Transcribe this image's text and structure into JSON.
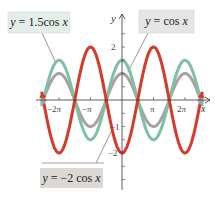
{
  "chart_data": {
    "type": "line",
    "title": "",
    "xlabel": "x",
    "ylabel": "y",
    "xlim": [
      -8.2,
      8.2
    ],
    "ylim": [
      -3.4,
      3.1
    ],
    "x_ticks": [
      {
        "value": -6.2832,
        "label": "−2π"
      },
      {
        "value": -3.1416,
        "label": "−π"
      },
      {
        "value": 3.1416,
        "label": "π"
      },
      {
        "value": 6.2832,
        "label": "2π"
      }
    ],
    "y_ticks": [
      {
        "value": 2,
        "label": "2"
      },
      {
        "value": -1,
        "label": "−1"
      },
      {
        "value": -2,
        "label": "−2"
      }
    ],
    "grid": false,
    "series": [
      {
        "name": "y = 1.5cos x",
        "expression": "1.5*cos(x)",
        "amplitude": 1.5,
        "color": "#7fbfa4"
      },
      {
        "name": "y = cos x",
        "expression": "cos(x)",
        "amplitude": 1,
        "color": "#a8a2a4"
      },
      {
        "name": "y = −2 cos x",
        "expression": "-2*cos(x)",
        "amplitude": -2,
        "color": "#d63a2a"
      }
    ],
    "annotations": [
      {
        "text": "y = 1.5cos x",
        "box_color": "#e3eee8"
      },
      {
        "text": "y = cos x",
        "box_color": "#e5e5e5"
      },
      {
        "text": "y = −2 cos x",
        "box_color": "#dcd9d4"
      }
    ]
  },
  "labels": {
    "green": {
      "y": "y",
      "eq": " = 1.5cos ",
      "x": "x"
    },
    "gray": {
      "y": "y",
      "eq": " = cos ",
      "x": "x"
    },
    "red": {
      "y": "y",
      "eq": " = −2 cos ",
      "x": "x"
    }
  },
  "axis": {
    "x_label": "x",
    "y_label": "y"
  }
}
